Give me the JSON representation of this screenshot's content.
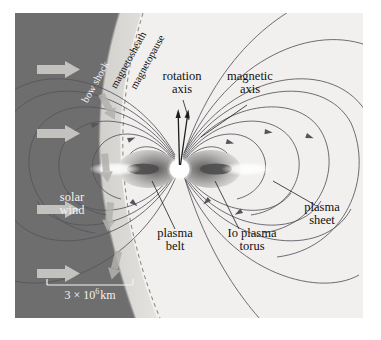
{
  "figure": {
    "background_color": "#f0efed",
    "solar_wind_color": "#6e6e6e",
    "magnetosheath_color": "#c9c8c4",
    "inner_color": "#f2f1ef",
    "fieldline_color": "#4a4a52",
    "lobe_color": "#b9b8b6",
    "lobe_core_color": "#5d5c5c"
  },
  "labels": {
    "solar_wind": "solar\nwind",
    "solar_wind_line1": "solar",
    "solar_wind_line2": "wind",
    "bow_shock": "bow shock",
    "magnetosheath": "magnetosheath",
    "magnetopause": "magnetopause",
    "rotation_axis_line1": "rotation",
    "rotation_axis_line2": "axis",
    "magnetic_axis_line1": "magnetic",
    "magnetic_axis_line2": "axis",
    "plasma_belt_line1": "plasma",
    "plasma_belt_line2": "belt",
    "io_plasma_torus_line1": "Io plasma",
    "io_plasma_torus_line2": "torus",
    "plasma_sheet_line1": "plasma",
    "plasma_sheet_line2": "sheet",
    "scale_bar": "3 × 10⁶ km",
    "scale_value": "3",
    "scale_times": "×",
    "scale_power_base": "10",
    "scale_power_exp": "6",
    "scale_unit": "km"
  },
  "diagram_data": {
    "type": "schematic",
    "regions": [
      {
        "name": "solar wind",
        "shade": "dark gray",
        "position": "left"
      },
      {
        "name": "magnetosheath",
        "shade": "medium gray",
        "position": "crescent band"
      },
      {
        "name": "magnetosphere interior",
        "shade": "near white",
        "position": "right"
      }
    ],
    "boundaries": [
      {
        "name": "bow shock",
        "style": "solid shaded edge"
      },
      {
        "name": "magnetopause",
        "style": "dashed curve"
      }
    ],
    "axes": [
      {
        "name": "rotation axis",
        "tilt_deg": 0
      },
      {
        "name": "magnetic axis",
        "tilt_deg": 10
      }
    ],
    "features": [
      "dipole magnetic field lines",
      "plasma belt",
      "Io plasma torus",
      "plasma sheet",
      "solar wind flow arrows",
      "magnetosheath flow arrows"
    ],
    "scale_bar_length_km": 3000000
  }
}
